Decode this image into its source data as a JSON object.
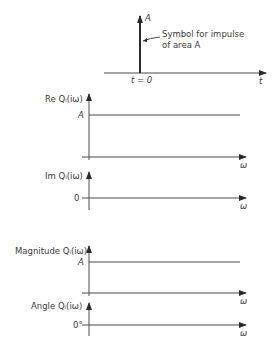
{
  "impulse_plot": {
    "amplitude_label": "A",
    "annotation_line1": "Symbol for impulse",
    "annotation_line2": "of area A",
    "origin_label": "t = 0",
    "axis_label": "t"
  },
  "real_plot": {
    "y_label": "Re Qᵢ(iω)",
    "level_label": "A",
    "x_label": "ω"
  },
  "imag_plot": {
    "y_label": "Im Qᵢ(iω)",
    "level_label": "0",
    "x_label": "ω"
  },
  "magnitude_plot": {
    "y_label": "Magnitude Qᵢ(iω)",
    "level_label": "A",
    "x_label": "ω"
  },
  "angle_plot": {
    "y_label": "Angle Qᵢ(iω)",
    "level_label": "0°",
    "x_label": "ω"
  },
  "colors": {
    "line": "#4a4a4a",
    "text": "#3a3a3a",
    "background": "#ffffff"
  }
}
